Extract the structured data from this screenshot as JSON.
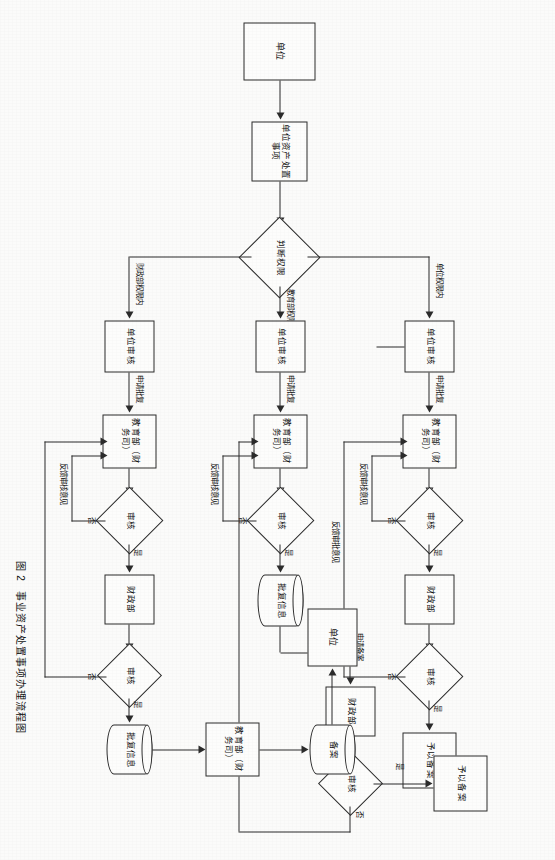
{
  "figure": {
    "caption_number": "图 2",
    "caption_title": "事业资产处置事项办理流程图"
  },
  "labels": {
    "yes": "是",
    "no": "否",
    "unit_scope": "单位权限内",
    "moe_scope": "教育部权限内",
    "mof_scope": "财政部权限内",
    "apply_approval": "申请批复",
    "apply_record": "申请备案",
    "feedback_review": "反馈审核意见",
    "feedback_approval": "反馈审批意见"
  },
  "nodes": {
    "start_unit": "单位",
    "start_task": "单位资产处置事项",
    "decision_authority": "判断权限",
    "unit_review": "单位审核",
    "moe_finance": "教育部（财务司）",
    "review": "审核",
    "mof": "财政部",
    "grant_record": "予以备案",
    "approval_info": "批复信息",
    "record_store": "备案",
    "end_unit": "单位"
  },
  "rows": [
    {
      "id": "row-unit",
      "branch_label": "单位权限内",
      "sequence": [
        "单位审核",
        "教育部（财务司）",
        "审核",
        "财政部",
        "审核",
        "予以备案"
      ],
      "edge_labels": [
        "申请批复",
        "是",
        "否",
        "是",
        "否",
        "反馈审核意见",
        "反馈审批意见"
      ]
    },
    {
      "id": "row-moe",
      "branch_label": "教育部权限内",
      "sequence": [
        "单位审核",
        "教育部（财务司）",
        "审核",
        "批复信息",
        "财政部",
        "审核",
        "予以备案"
      ],
      "edge_labels": [
        "申请批复",
        "是",
        "否",
        "申请备案",
        "是",
        "否",
        "反馈审核意见"
      ]
    },
    {
      "id": "row-mof",
      "branch_label": "财政部权限内",
      "sequence": [
        "单位审核",
        "教育部（财务司）",
        "审核",
        "财政部",
        "审核",
        "批复信息",
        "教育部（财务司）",
        "备案",
        "单位"
      ],
      "edge_labels": [
        "申请批复",
        "是",
        "否",
        "是",
        "否",
        "反馈审核意见"
      ]
    }
  ]
}
